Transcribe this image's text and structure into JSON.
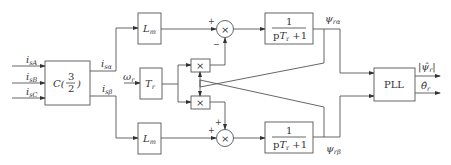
{
  "diagram": {
    "inputs": [
      {
        "name": "i",
        "sub": "sA"
      },
      {
        "name": "i",
        "sub": "sB"
      },
      {
        "name": "i",
        "sub": "sC"
      }
    ],
    "transform_block": {
      "label": "C(",
      "num": "3",
      "den": "2",
      "close": ")"
    },
    "transform_outputs": [
      {
        "name": "i",
        "sub": "sα"
      },
      {
        "name": "i",
        "sub": "sβ"
      }
    ],
    "lm_top": {
      "name": "L",
      "sub": "m"
    },
    "lm_bottom": {
      "name": "L",
      "sub": "m"
    },
    "omega_input": {
      "name": "ω",
      "sub": "r"
    },
    "tr_block": {
      "name": "T",
      "sub": "r"
    },
    "multiplier_symbol": "×",
    "sum_top_signs": {
      "plus": "+",
      "minus": "−"
    },
    "sum_bottom_signs": {
      "plus1": "+",
      "plus2": "+"
    },
    "filter_top": {
      "num": "1",
      "den_p": "p",
      "den_T": "T",
      "den_sub": "r",
      "den_rest": " +1"
    },
    "filter_bottom": {
      "num": "1",
      "den_p": "p",
      "den_T": "T",
      "den_sub": "r",
      "den_rest": " +1"
    },
    "flux_outputs": [
      {
        "name": "ψ",
        "sub": "rα"
      },
      {
        "name": "ψ",
        "sub": "rβ"
      }
    ],
    "pll_block": {
      "label": "PLL"
    },
    "pll_outputs": [
      {
        "name": "|ψ̂",
        "sub": "r",
        "close": "|"
      },
      {
        "name": "θ̂",
        "sub": "r"
      }
    ]
  }
}
